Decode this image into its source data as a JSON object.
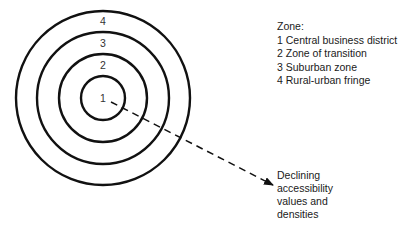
{
  "diagram": {
    "type": "concentric-zone-model",
    "center": [
      103,
      98
    ],
    "zones": [
      {
        "number": "1",
        "radius": 22,
        "label_pos": [
          103,
          102
        ]
      },
      {
        "number": "2",
        "radius": 44,
        "label_pos": [
          103,
          69
        ]
      },
      {
        "number": "3",
        "radius": 66,
        "label_pos": [
          103,
          47
        ]
      },
      {
        "number": "4",
        "radius": 87,
        "label_pos": [
          103,
          25
        ]
      }
    ],
    "arrow": {
      "from": [
        111,
        102
      ],
      "to": [
        273,
        185
      ],
      "style": "dashed"
    }
  },
  "legend": {
    "title": "Zone:",
    "items": [
      "1 Central business district",
      "2 Zone of transition",
      "3 Suburban zone",
      "4 Rural-urban fringe"
    ]
  },
  "note": {
    "lines": [
      "Declining",
      "accessibility",
      "values and",
      "densities"
    ]
  }
}
